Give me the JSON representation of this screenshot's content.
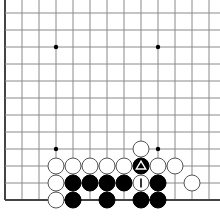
{
  "board": {
    "title": "Go board corner diagram",
    "origin_x": 5,
    "origin_y": 13,
    "spacing": 17,
    "cols": 13,
    "rows": 12,
    "left_edge": true,
    "bottom_edge": true,
    "stone_radius": 8,
    "colors": {
      "black": "#000000",
      "white": "#ffffff",
      "grid": "#8a8a8a",
      "edge": "#444444"
    },
    "star_points": [
      {
        "col": 3,
        "row": 2
      },
      {
        "col": 9,
        "row": 2
      },
      {
        "col": 3,
        "row": 8
      },
      {
        "col": 9,
        "row": 8
      }
    ],
    "stones": [
      {
        "col": 8,
        "row": 8,
        "color": "white"
      },
      {
        "col": 3,
        "row": 9,
        "color": "white"
      },
      {
        "col": 4,
        "row": 9,
        "color": "white"
      },
      {
        "col": 5,
        "row": 9,
        "color": "white"
      },
      {
        "col": 6,
        "row": 9,
        "color": "white"
      },
      {
        "col": 7,
        "row": 9,
        "color": "white"
      },
      {
        "col": 8,
        "row": 9,
        "color": "black",
        "mark": "triangle"
      },
      {
        "col": 9,
        "row": 9,
        "color": "white"
      },
      {
        "col": 10,
        "row": 9,
        "color": "white"
      },
      {
        "col": 3,
        "row": 10,
        "color": "white"
      },
      {
        "col": 4,
        "row": 10,
        "color": "black"
      },
      {
        "col": 5,
        "row": 10,
        "color": "black"
      },
      {
        "col": 6,
        "row": 10,
        "color": "black"
      },
      {
        "col": 7,
        "row": 10,
        "color": "black"
      },
      {
        "col": 8,
        "row": 10,
        "color": "white",
        "mark": "I"
      },
      {
        "col": 9,
        "row": 10,
        "color": "black"
      },
      {
        "col": 11,
        "row": 10,
        "color": "white"
      },
      {
        "col": 3,
        "row": 11,
        "color": "white"
      },
      {
        "col": 4,
        "row": 11,
        "color": "black"
      },
      {
        "col": 6,
        "row": 11,
        "color": "black"
      },
      {
        "col": 8,
        "row": 11,
        "color": "black"
      },
      {
        "col": 9,
        "row": 11,
        "color": "black"
      }
    ],
    "marks_legend": {
      "triangle": "last-move-triangle-marker",
      "I": "label-I"
    }
  }
}
